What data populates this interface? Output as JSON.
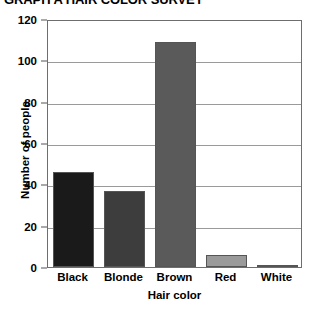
{
  "chart_data": {
    "type": "bar",
    "title": "GRAPH A HAIR COLOR SURVEY",
    "xlabel": "Hair color",
    "ylabel": "Number of people",
    "categories": [
      "Black",
      "Blonde",
      "Brown",
      "Red",
      "White"
    ],
    "values": [
      46,
      37,
      109,
      6,
      1
    ],
    "ylim": [
      0,
      120
    ],
    "yticks": [
      0,
      20,
      40,
      60,
      80,
      100,
      120
    ],
    "ytick_labels": [
      "0",
      "20",
      "40",
      "60",
      "80",
      "100",
      "120"
    ],
    "grid": "horizontal",
    "legend": "none",
    "bar_colors": [
      "#1a1a1a",
      "#3d3d3d",
      "#5a5a5a",
      "#9a9a9a",
      "#f2f2f2"
    ],
    "bar_edge_color": "#555555",
    "frame_color": "#6e6e6e",
    "gridline_color": "#9a9a9a",
    "background": "#ffffff"
  }
}
